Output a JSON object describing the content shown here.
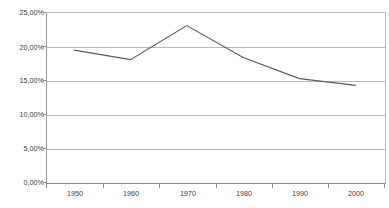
{
  "chart_data": {
    "type": "line",
    "title": "",
    "subtitle": "",
    "xlabel": "",
    "ylabel": "",
    "categories": [
      "1950",
      "1960",
      "1970",
      "1980",
      "1990",
      "2000"
    ],
    "x": [
      1950,
      1960,
      1970,
      1980,
      1990,
      2000
    ],
    "values": [
      19.4,
      18.0,
      23.0,
      18.3,
      15.2,
      14.2
    ],
    "series": [
      {
        "name": "",
        "values": [
          19.4,
          18.0,
          23.0,
          18.3,
          15.2,
          14.2
        ]
      }
    ],
    "ylim": [
      0,
      25
    ],
    "xlim": [
      1945,
      2005
    ],
    "ytick_values": [
      25,
      20,
      15,
      10,
      5,
      0
    ],
    "ytick_labels": [
      "25,00%",
      "20,00%",
      "15,00%",
      "10,00%",
      "5,00%",
      "0,00%"
    ],
    "xtick_labels": [
      "1950",
      "1960",
      "1970",
      "1980",
      "1990",
      "2000"
    ],
    "grid": "horizontal",
    "legend": "none",
    "annotations": [],
    "colors": {
      "series_line": "#595959",
      "gridline": "#b9b9b9",
      "axis": "#8e8e8e",
      "plot_background": "#ffffff",
      "tick_label": "#3a3a3a"
    }
  }
}
